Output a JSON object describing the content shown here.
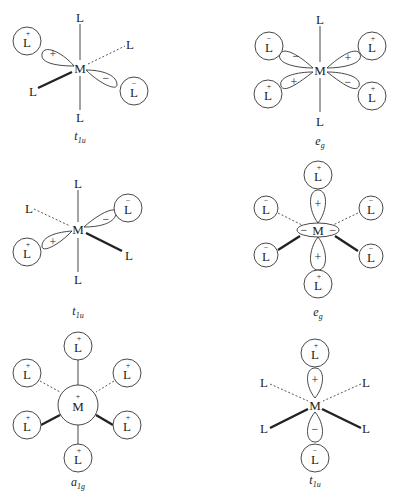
{
  "figure": {
    "atoms": {
      "metal": "M",
      "ligand": "L"
    },
    "signs": {
      "plus": "+",
      "minus": "−"
    },
    "panels": [
      {
        "id": "p1",
        "caption_main": "t",
        "caption_sub": "1u",
        "description": "p orbital along diagonal, + lobe toward upper-left L, − lobe toward lower-right L",
        "lobe_signs": [
          "+",
          "−"
        ],
        "ligand_signs": [
          "+",
          "−"
        ]
      },
      {
        "id": "p2",
        "caption_main": "e",
        "caption_sub": "g",
        "description": "d orbital with four lobes in plane",
        "lobe_signs": [
          "−",
          "+",
          "+",
          "−"
        ],
        "ligand_signs": [
          "−",
          "+",
          "+",
          "+"
        ]
      },
      {
        "id": "p3",
        "caption_main": "t",
        "caption_sub": "1u",
        "description": "p orbital, + lobe lower-left, − lobe upper-right",
        "lobe_signs": [
          "+",
          "−"
        ],
        "ligand_signs": [
          "+",
          "−"
        ]
      },
      {
        "id": "p4",
        "caption_main": "e",
        "caption_sub": "g",
        "description": "dz2 orbital with + axial lobes and − torus",
        "lobe_signs": [
          "+",
          "+",
          "−",
          "−"
        ],
        "ligand_signs": [
          "+",
          "+",
          "−",
          "−",
          "−",
          "−"
        ]
      },
      {
        "id": "p5",
        "caption_main": "a",
        "caption_sub": "1g",
        "description": "s orbital, all ligands +",
        "metal_sign": "+",
        "ligand_signs": [
          "+",
          "+",
          "+",
          "+",
          "+",
          "+"
        ]
      },
      {
        "id": "p6",
        "caption_main": "t",
        "caption_sub": "1u",
        "description": "pz orbital vertical, + lobe up, − lobe down",
        "lobe_signs": [
          "+",
          "−"
        ],
        "ligand_signs": [
          "+",
          "−"
        ]
      }
    ]
  }
}
